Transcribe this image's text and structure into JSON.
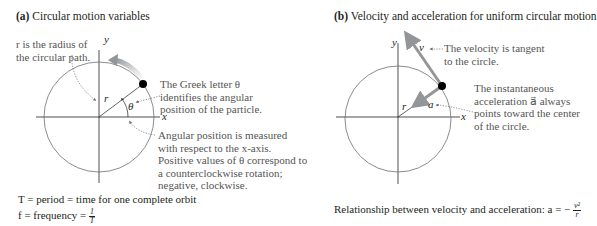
{
  "panel_a": {
    "label": "(a)",
    "title": "Circular motion variables",
    "axis_x": "x",
    "axis_y": "y",
    "radius_label": "r",
    "angle_label": "θ",
    "note_radius": "r is the radius of the circular path.",
    "note_theta": "The Greek letter θ identifies the angular position of the particle.",
    "note_angle": "Angular position is measured with respect to the x-axis. Positive values of θ correspond to a counterclockwise rotation; negative, clockwise.",
    "eq_period": "T = period = time for one complete orbit",
    "eq_freq_lhs": "f = frequency =",
    "eq_freq_num": "1",
    "eq_freq_den": "T"
  },
  "panel_b": {
    "label": "(b)",
    "title": "Velocity and acceleration for uniform circular motion",
    "axis_x": "x",
    "axis_y": "y",
    "radius_label": "r",
    "velocity_label": "v⃗",
    "accel_label": "a⃗",
    "note_velocity": "The velocity is tangent to the circle.",
    "note_accel": "The instantaneous acceleration a⃗ always points toward the center of the circle.",
    "eq_relation_lhs": "Relationship between velocity and acceleration: a = −",
    "eq_relation_num": "v²",
    "eq_relation_den": "r"
  },
  "colors": {
    "axis": "#231f20",
    "circle": "#6d6e71",
    "vector": "#939598",
    "particle": "#000000",
    "dotted": "#6d6e71",
    "note_text": "#555555"
  }
}
